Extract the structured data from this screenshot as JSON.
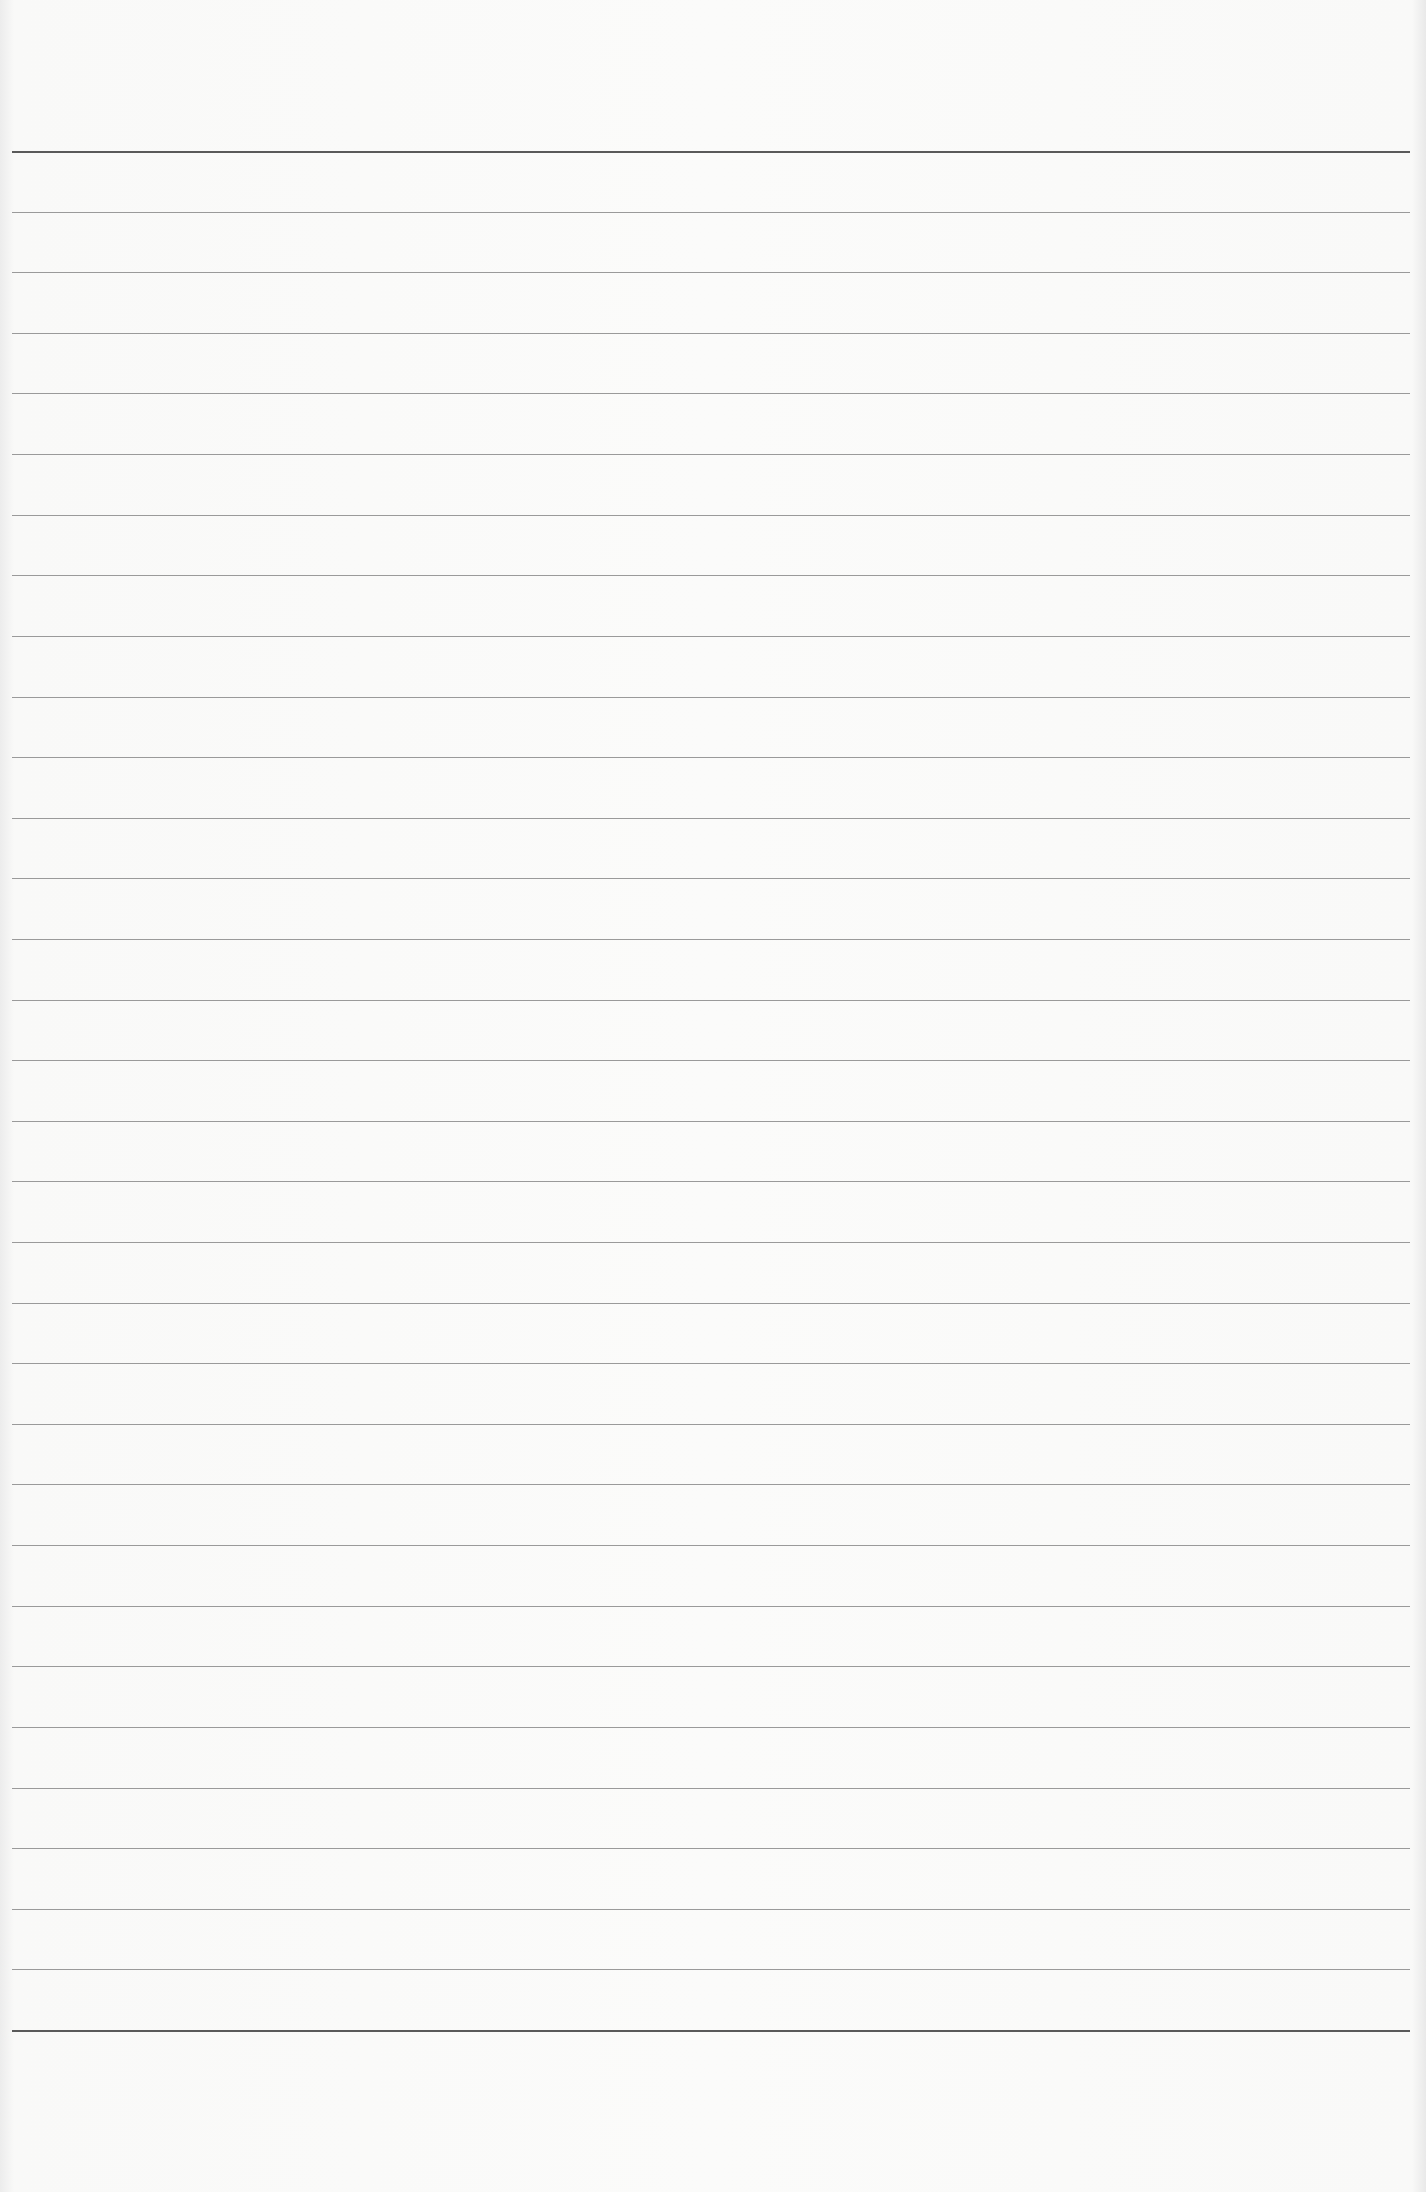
{
  "document": {
    "type": "ruled-paper",
    "text": "",
    "top_rule_y": 151,
    "bottom_rule_y": 2030,
    "rule_count": 32,
    "thin_rule_color": "#9a9a9a",
    "thick_rule_color": "#5a5a5a",
    "paper_color": "#fbfbfa"
  }
}
